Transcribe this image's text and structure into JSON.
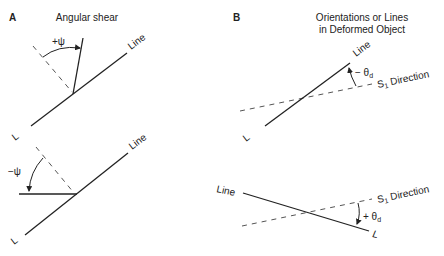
{
  "panels": [
    {
      "letter": "A",
      "title": "Angular shear",
      "subtitle": "",
      "top": {
        "line_label": "Line",
        "end_label": "L",
        "angle_label": "+ψ"
      },
      "bottom": {
        "line_label": "Line",
        "end_label": "L",
        "angle_label": "−ψ"
      }
    },
    {
      "letter": "B",
      "title": "Orientations or Lines",
      "subtitle": "in Deformed Object",
      "top": {
        "line_label": "Line",
        "end_label": "L",
        "angle_label": "− θ",
        "angle_sub": "d",
        "direction_label": "S",
        "direction_sub": "1",
        "direction_suffix": " Direction"
      },
      "bottom": {
        "line_label": "Line",
        "end_label": "L",
        "angle_label": "+ θ",
        "angle_sub": "d",
        "direction_label": "S",
        "direction_sub": "1",
        "direction_suffix": " Direction"
      }
    }
  ],
  "colors": {
    "ink": "#222222",
    "dash": "#555555",
    "background": "#ffffff"
  }
}
